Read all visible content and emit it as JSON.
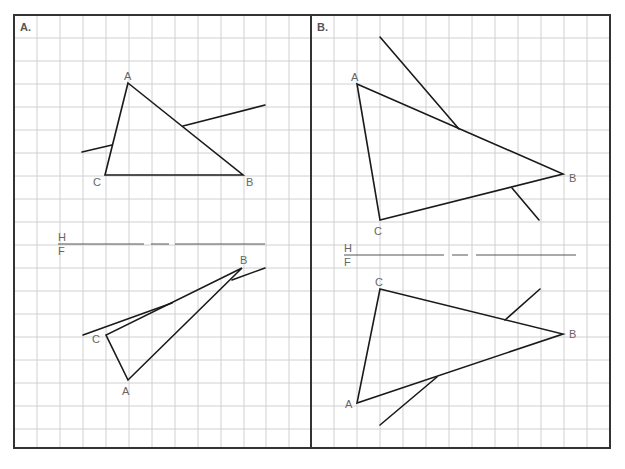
{
  "panels": [
    {
      "label": "A.",
      "fold_line": {
        "top_label": "H",
        "bottom_label": "F"
      },
      "top_view": {
        "vertices": {
          "A": "A",
          "B": "B",
          "C": "C"
        }
      },
      "front_view": {
        "vertices": {
          "A": "A",
          "B": "B",
          "C": "C"
        }
      }
    },
    {
      "label": "B.",
      "fold_line": {
        "top_label": "H",
        "bottom_label": "F"
      },
      "top_view": {
        "vertices": {
          "A": "A",
          "B": "B",
          "C": "C"
        }
      },
      "front_view": {
        "vertices": {
          "A": "A",
          "B": "B",
          "C": "C"
        }
      }
    }
  ],
  "colors": {
    "grid": "#d0d0d0",
    "border": "#333333",
    "line": "#1a1a1a",
    "label": "#666666"
  }
}
